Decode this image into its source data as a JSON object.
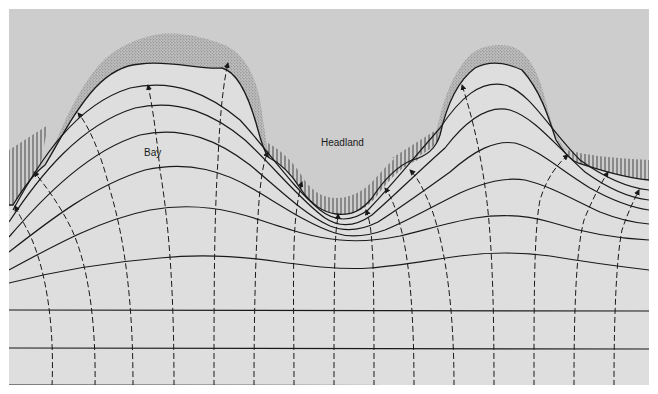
{
  "diagram": {
    "type": "wave-refraction",
    "labels": {
      "bay": "Bay",
      "headland": "Headland"
    },
    "colors": {
      "land": "#cdcdcd",
      "sea": "#dedede",
      "beach_stipple": "#8a8a8a",
      "line": "#1a1a1a",
      "frame": "#ffffff"
    },
    "elements": {
      "wave_crests": "solid curved lines, straight offshore, bending to follow coastline",
      "wave_orthogonals": "dashed lines with arrowheads pointing toward shore",
      "beaches": "stippled regions at the heads of the two embayments",
      "cliffs": "vertical hatching along protruding shoreline segments"
    }
  }
}
